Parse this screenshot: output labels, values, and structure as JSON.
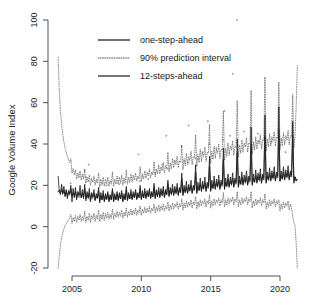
{
  "chart_data": {
    "type": "line",
    "title": "",
    "xlabel": "",
    "ylabel": "Google Volume Index",
    "xlim": [
      2003.8,
      2021.2
    ],
    "ylim": [
      -20,
      100
    ],
    "xticks": [
      2005,
      2010,
      2015,
      2020
    ],
    "xtick_labels": [
      "2005",
      "2010",
      "2015",
      "2020"
    ],
    "yticks": [
      -20,
      0,
      20,
      40,
      60,
      80,
      100
    ],
    "ytick_labels": [
      "-20",
      "0",
      "20",
      "40",
      "60",
      "80",
      "100"
    ],
    "grid": false,
    "legend_position": "top-center",
    "legend": [
      {
        "label": "one-step-ahead",
        "style": "solid",
        "color": "#111111"
      },
      {
        "label": "90% prediction interval",
        "style": "dotted",
        "color": "#5a5a5a"
      },
      {
        "label": "12-steps-ahead",
        "style": "solid",
        "color": "#555555"
      }
    ],
    "series": [
      {
        "name": "one-step-ahead",
        "style": "solid",
        "comment": "monthly fitted values, Jan 2004 - Dec 2020, strong December seasonal spikes growing over time",
        "x_start": 2004.0,
        "x_step": 0.08333,
        "values": [
          24.5,
          17.0,
          15.5,
          20.5,
          16.0,
          19.5,
          14.5,
          18.0,
          13.5,
          17.5,
          16.0,
          20.0,
          12.0,
          18.5,
          14.0,
          19.0,
          13.0,
          17.0,
          15.5,
          20.0,
          14.0,
          18.0,
          13.5,
          20.5,
          12.5,
          17.0,
          14.0,
          18.5,
          12.0,
          16.5,
          14.5,
          18.0,
          12.5,
          16.0,
          14.0,
          19.0,
          11.5,
          16.5,
          13.0,
          17.5,
          12.0,
          16.0,
          13.5,
          17.0,
          12.0,
          15.5,
          13.0,
          18.5,
          12.0,
          16.0,
          13.0,
          17.0,
          12.5,
          16.5,
          13.5,
          17.5,
          12.0,
          16.0,
          13.0,
          19.5,
          12.5,
          16.5,
          13.5,
          18.0,
          13.0,
          17.0,
          14.0,
          18.0,
          13.0,
          16.5,
          14.0,
          20.0,
          13.0,
          17.5,
          14.0,
          18.5,
          13.5,
          17.5,
          14.5,
          18.5,
          13.5,
          17.0,
          14.5,
          21.0,
          13.5,
          18.0,
          14.5,
          19.0,
          14.0,
          18.5,
          15.0,
          19.5,
          14.0,
          18.0,
          15.5,
          22.5,
          14.5,
          19.0,
          15.5,
          20.5,
          15.0,
          19.5,
          16.0,
          21.0,
          15.0,
          19.0,
          16.5,
          26.0,
          15.0,
          20.0,
          16.5,
          22.0,
          16.0,
          20.5,
          17.5,
          22.5,
          16.0,
          20.0,
          18.0,
          30.0,
          16.0,
          21.5,
          17.5,
          23.5,
          17.0,
          22.0,
          18.5,
          24.0,
          17.0,
          21.5,
          19.5,
          34.0,
          17.0,
          22.5,
          18.5,
          24.5,
          18.0,
          23.0,
          19.5,
          25.0,
          18.0,
          22.5,
          20.5,
          38.0,
          18.0,
          23.5,
          19.5,
          25.5,
          19.0,
          24.0,
          20.5,
          26.0,
          19.0,
          23.5,
          21.5,
          42.5,
          19.0,
          24.5,
          20.5,
          26.5,
          20.0,
          25.0,
          21.5,
          27.0,
          20.0,
          24.5,
          22.5,
          48.0,
          20.0,
          25.5,
          21.5,
          27.5,
          21.0,
          26.0,
          22.5,
          28.0,
          21.0,
          25.5,
          23.5,
          54.0,
          21.0,
          26.5,
          22.5,
          28.5,
          22.0,
          27.0,
          23.5,
          29.0,
          22.0,
          26.5,
          24.5,
          58.0,
          22.0,
          27.0,
          23.0,
          29.0,
          22.5,
          27.5,
          24.0,
          29.5,
          22.5,
          27.0,
          25.0,
          51.0,
          21.0,
          24.0,
          22.0,
          23.0
        ]
      },
      {
        "name": "12-steps-ahead",
        "style": "solid",
        "comment": "smoother 12-step-ahead forecast path tracking the same seasonal pattern",
        "x_start": 2004.0,
        "x_step": 0.08333,
        "values": [
          17.0,
          17.5,
          16.5,
          18.0,
          16.0,
          17.5,
          15.5,
          17.0,
          15.0,
          16.5,
          15.5,
          18.5,
          14.5,
          16.5,
          15.0,
          17.0,
          14.0,
          16.0,
          14.5,
          17.0,
          14.0,
          16.0,
          14.5,
          18.5,
          13.5,
          15.5,
          14.0,
          16.5,
          13.0,
          15.5,
          14.0,
          16.5,
          13.0,
          15.0,
          13.5,
          17.5,
          12.5,
          15.0,
          13.0,
          16.0,
          12.5,
          15.0,
          13.0,
          16.0,
          12.5,
          14.5,
          13.0,
          17.5,
          12.5,
          15.0,
          13.0,
          16.0,
          13.0,
          15.5,
          13.5,
          16.5,
          12.5,
          15.0,
          13.0,
          18.0,
          13.0,
          15.5,
          13.5,
          16.5,
          13.5,
          16.0,
          14.0,
          17.0,
          13.5,
          15.5,
          14.0,
          18.5,
          13.5,
          16.0,
          14.0,
          17.0,
          14.0,
          16.5,
          14.5,
          17.5,
          14.0,
          16.0,
          14.5,
          19.5,
          14.0,
          16.5,
          15.0,
          17.5,
          14.5,
          17.0,
          15.5,
          18.0,
          14.5,
          17.0,
          15.5,
          21.0,
          15.0,
          17.5,
          16.0,
          18.5,
          15.5,
          18.0,
          16.5,
          19.0,
          15.5,
          18.0,
          16.5,
          23.5,
          15.5,
          18.5,
          16.5,
          19.5,
          16.5,
          19.0,
          17.5,
          20.0,
          16.5,
          19.0,
          17.5,
          26.5,
          16.5,
          19.5,
          17.5,
          21.0,
          17.5,
          20.0,
          18.5,
          21.5,
          17.5,
          20.0,
          18.5,
          29.5,
          17.5,
          20.5,
          18.5,
          22.0,
          18.5,
          21.0,
          19.5,
          22.5,
          18.5,
          21.0,
          19.5,
          32.5,
          18.5,
          21.5,
          19.5,
          23.0,
          19.5,
          22.0,
          20.5,
          23.5,
          19.5,
          22.0,
          20.5,
          36.0,
          19.5,
          22.5,
          20.5,
          24.0,
          20.5,
          23.0,
          21.5,
          24.5,
          20.5,
          23.0,
          21.5,
          40.0,
          20.5,
          23.5,
          21.5,
          25.0,
          21.5,
          24.0,
          22.5,
          25.5,
          21.5,
          24.0,
          22.5,
          44.0,
          21.5,
          24.5,
          22.5,
          26.0,
          22.5,
          25.0,
          23.5,
          26.5,
          22.5,
          25.0,
          23.5,
          47.0,
          22.0,
          25.0,
          23.0,
          26.5,
          23.0,
          25.5,
          24.0,
          27.0,
          23.0,
          25.5,
          24.0,
          44.0,
          22.0,
          24.0,
          22.5,
          23.0
        ]
      },
      {
        "name": "90% prediction interval upper",
        "style": "dotted",
        "comment": "upper 90% bound; starts near 82 in 2004 then narrows and tracks the spikes, reaching ~78 at the right edge",
        "x_start": 2004.0,
        "x_step": 0.08333,
        "values": [
          82.0,
          66.0,
          56.0,
          50.0,
          45.0,
          41.0,
          38.0,
          36.0,
          34.0,
          32.5,
          31.0,
          33.0,
          26.0,
          28.0,
          25.0,
          27.5,
          23.0,
          26.0,
          23.5,
          27.0,
          22.5,
          25.5,
          23.0,
          28.0,
          21.0,
          24.0,
          21.5,
          25.0,
          20.0,
          23.5,
          21.5,
          24.5,
          20.0,
          23.0,
          21.0,
          26.0,
          19.0,
          23.0,
          20.0,
          24.0,
          19.5,
          23.0,
          20.5,
          24.0,
          19.5,
          22.5,
          20.5,
          26.5,
          19.5,
          23.0,
          20.5,
          24.5,
          20.5,
          24.0,
          21.0,
          25.0,
          20.0,
          23.5,
          21.0,
          27.5,
          20.5,
          24.0,
          21.5,
          25.5,
          21.5,
          25.0,
          22.5,
          26.0,
          22.0,
          24.5,
          23.0,
          29.0,
          22.0,
          25.5,
          23.0,
          27.0,
          23.5,
          26.5,
          24.5,
          28.0,
          23.5,
          26.5,
          25.0,
          31.5,
          24.0,
          28.0,
          25.5,
          30.0,
          25.5,
          29.0,
          27.0,
          31.0,
          26.0,
          29.5,
          28.0,
          36.0,
          26.5,
          31.0,
          28.0,
          33.0,
          28.5,
          32.0,
          30.0,
          34.0,
          28.5,
          32.0,
          31.0,
          39.5,
          27.5,
          33.0,
          29.5,
          35.5,
          30.0,
          34.0,
          32.0,
          36.5,
          30.0,
          34.0,
          33.5,
          44.5,
          29.0,
          35.0,
          31.0,
          37.5,
          31.5,
          36.0,
          34.0,
          38.5,
          31.5,
          36.0,
          35.5,
          49.5,
          30.5,
          36.5,
          32.5,
          39.0,
          33.0,
          37.5,
          35.5,
          40.0,
          33.0,
          37.5,
          37.0,
          56.0,
          32.0,
          38.0,
          34.0,
          40.5,
          34.5,
          39.0,
          37.0,
          41.5,
          34.5,
          39.0,
          38.5,
          61.0,
          33.5,
          39.5,
          35.5,
          42.0,
          36.0,
          40.5,
          38.5,
          43.0,
          36.0,
          40.5,
          40.0,
          66.0,
          35.0,
          41.0,
          37.0,
          43.5,
          37.5,
          42.0,
          40.0,
          44.5,
          37.5,
          42.0,
          41.5,
          72.5,
          36.5,
          42.5,
          38.5,
          45.0,
          39.0,
          43.5,
          41.5,
          46.0,
          39.0,
          43.5,
          43.0,
          70.0,
          37.0,
          43.0,
          39.0,
          45.5,
          39.5,
          44.0,
          42.0,
          46.5,
          39.5,
          44.0,
          43.5,
          64.0,
          38.0,
          44.0,
          58.0,
          78.0
        ]
      },
      {
        "name": "90% prediction interval lower",
        "style": "dotted",
        "comment": "lower 90% bound; starts near -20 in 2004 then rises and stabilises around 5-15, widening downward at the right edge",
        "x_start": 2004.0,
        "x_step": 0.08333,
        "values": [
          -20.0,
          -14.0,
          -9.0,
          -5.5,
          -3.0,
          -1.0,
          0.5,
          1.5,
          2.5,
          3.5,
          4.0,
          6.0,
          1.5,
          4.5,
          2.5,
          5.5,
          2.0,
          5.0,
          3.0,
          6.0,
          2.5,
          5.0,
          3.0,
          7.5,
          2.0,
          5.0,
          3.0,
          6.5,
          2.0,
          5.5,
          3.5,
          6.5,
          2.5,
          5.5,
          3.5,
          8.0,
          2.5,
          6.0,
          3.5,
          7.0,
          3.0,
          6.5,
          4.0,
          7.0,
          3.5,
          6.0,
          4.0,
          8.5,
          3.5,
          6.5,
          4.5,
          7.5,
          4.5,
          7.0,
          5.0,
          8.0,
          4.0,
          7.0,
          5.0,
          9.0,
          4.5,
          7.5,
          5.5,
          8.5,
          5.5,
          8.0,
          6.0,
          9.0,
          5.5,
          8.0,
          6.5,
          10.0,
          5.5,
          8.5,
          6.5,
          9.5,
          6.5,
          9.0,
          7.0,
          10.0,
          6.5,
          9.0,
          7.5,
          11.0,
          6.5,
          9.5,
          7.5,
          10.5,
          7.5,
          10.0,
          8.0,
          11.0,
          7.5,
          10.0,
          8.5,
          12.0,
          7.5,
          10.5,
          8.5,
          11.5,
          8.5,
          11.0,
          9.5,
          12.0,
          8.5,
          11.0,
          9.5,
          13.5,
          8.0,
          11.5,
          9.0,
          12.5,
          9.5,
          12.0,
          10.0,
          13.0,
          9.0,
          12.0,
          10.5,
          14.5,
          8.5,
          12.0,
          9.5,
          13.0,
          10.0,
          12.5,
          11.0,
          13.5,
          9.5,
          12.5,
          11.0,
          15.5,
          9.0,
          12.5,
          10.0,
          13.5,
          10.5,
          13.0,
          11.5,
          14.0,
          10.0,
          13.0,
          11.5,
          16.5,
          9.5,
          13.0,
          10.5,
          14.0,
          11.0,
          13.5,
          12.0,
          14.5,
          10.5,
          13.5,
          12.0,
          17.0,
          9.5,
          13.0,
          10.5,
          14.0,
          11.0,
          13.5,
          12.0,
          14.5,
          10.5,
          13.5,
          12.0,
          17.0,
          9.0,
          12.5,
          10.0,
          13.5,
          10.5,
          13.0,
          11.5,
          14.0,
          10.0,
          13.0,
          11.5,
          16.0,
          8.5,
          12.0,
          9.5,
          13.0,
          10.0,
          12.5,
          11.0,
          13.5,
          9.5,
          12.5,
          11.0,
          13.0,
          7.5,
          11.0,
          8.5,
          12.0,
          9.0,
          11.5,
          10.0,
          12.5,
          8.0,
          11.0,
          9.0,
          5.0,
          2.0,
          0.5,
          -8.0,
          -20.0
        ]
      }
    ],
    "observed_points": {
      "name": "observed values",
      "comment": "scattered light-grey observed monthly points, a few large outliers above the forecast band",
      "x": [
        2004.0,
        2004.9,
        2005.9,
        2006.0,
        2007.5,
        2008.4,
        2009.9,
        2010.5,
        2011.0,
        2011.5,
        2011.9,
        2012.4,
        2012.9,
        2013.4,
        2013.9,
        2014.4,
        2014.9,
        2015.4,
        2015.9,
        2016.4,
        2016.9,
        2017.4,
        2017.9,
        2018.4,
        2018.9,
        2019.4,
        2019.9,
        2020.4,
        2016.6,
        2016.0,
        2014.8,
        2013.4,
        2011.8,
        2009.8,
        2006.2
      ],
      "y": [
        17.0,
        21.0,
        27.0,
        24.0,
        20.0,
        20.5,
        22.0,
        23.0,
        26.0,
        30.0,
        28.0,
        32.0,
        39.0,
        31.0,
        33.0,
        36.0,
        40.0,
        38.0,
        42.0,
        44.0,
        100.0,
        46.0,
        48.0,
        45.0,
        43.0,
        41.0,
        38.0,
        36.0,
        74.0,
        56.0,
        51.0,
        49.0,
        44.0,
        35.0,
        30.0
      ]
    }
  },
  "axis": {
    "ylabel": "Google Volume Index"
  }
}
